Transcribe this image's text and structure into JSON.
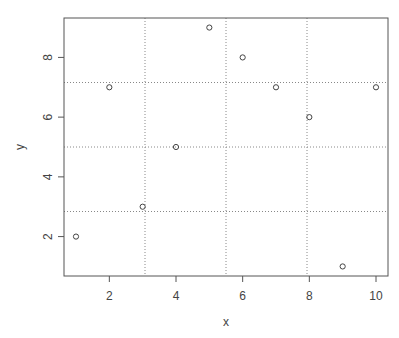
{
  "chart_data": {
    "type": "scatter",
    "title": "",
    "xlabel": "x",
    "ylabel": "y",
    "x": [
      1,
      2,
      3,
      4,
      5,
      6,
      7,
      8,
      9,
      10
    ],
    "y": [
      2,
      7,
      3,
      5,
      9,
      8,
      7,
      6,
      1,
      7
    ],
    "xlim": [
      0.64,
      10.36
    ],
    "ylim": [
      0.68,
      9.32
    ],
    "xticks": [
      2,
      4,
      6,
      8,
      10
    ],
    "yticks": [
      2,
      4,
      6,
      8
    ],
    "grid": {
      "on": true,
      "style": "dotted",
      "x_lines": [
        3.07,
        5.5,
        7.93
      ],
      "y_lines": [
        2.84,
        5.0,
        7.16
      ]
    },
    "marker": "open-circle",
    "legend": null
  },
  "colors": {
    "axis": "#555555",
    "grid": "#888888",
    "point": "#444444",
    "text": "#444444"
  }
}
